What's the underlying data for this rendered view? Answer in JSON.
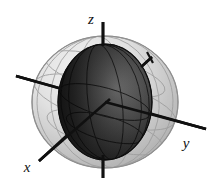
{
  "figure": {
    "kind": "3d-geometry-diagram",
    "title": "",
    "background_color": "#ffffff",
    "width": 216,
    "height": 190
  },
  "axes": {
    "label_z": "z",
    "label_y": "y",
    "label_x": "x",
    "line_color": "#101010",
    "label_color": "#111111",
    "z": {
      "name": "z-axis",
      "x1": 103,
      "y1": 22,
      "x2": 103,
      "y2": 178,
      "label_x": 91,
      "label_y": 24
    },
    "y": {
      "name": "y-axis",
      "x1": 16,
      "y1": 76,
      "x2": 206,
      "y2": 129,
      "label_x": 186,
      "label_y": 148
    },
    "x": {
      "name": "x-axis",
      "x1": 152,
      "y1": 57,
      "x2": 39,
      "y2": 161,
      "label_x": 27,
      "label_y": 172
    }
  },
  "outer_sphere": {
    "name": "outer-sphere",
    "cx": 105,
    "cy": 102,
    "rx": 73,
    "ry": 66,
    "fill_light": "#e6e6e6",
    "fill_dark": "#9d9d9d",
    "edge_color": "#8c8c8c",
    "opacity": 0.82,
    "meridian_color": "#8e8e8e"
  },
  "inner_ellipsoid": {
    "name": "inner-ellipsoid",
    "cx": 105,
    "cy": 102,
    "rx": 47,
    "ry": 58,
    "fill_dark": "#1b1b1b",
    "fill_mid": "#3c3c3c",
    "fill_light": "#6e6e6e",
    "highlight": "#7a7a7a",
    "edge_color": "#141414",
    "meridian_color": "#0d0d0d"
  },
  "tick_mark": {
    "name": "x-axis-tick",
    "x1": 147,
    "y1": 52,
    "x2": 152,
    "y2": 62,
    "color": "#141414"
  }
}
